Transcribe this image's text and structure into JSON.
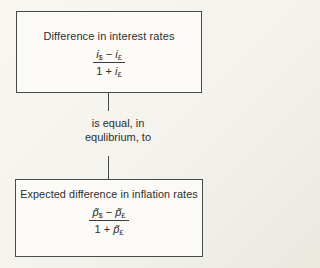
{
  "diagram": {
    "box1": {
      "title": "Difference in interest rates",
      "formula": {
        "num": {
          "v1": "i",
          "s1": "$",
          "op": "−",
          "v2": "i",
          "s2": "£"
        },
        "den": {
          "pre": "1 +",
          "v": "i",
          "s": "£"
        }
      }
    },
    "connector": {
      "line1": "is equal, in",
      "line2": "equlibrium, to"
    },
    "box2": {
      "title": "Expected difference in inflation rates",
      "formula": {
        "num": {
          "v1": "p̃",
          "s1": "$",
          "op": "−",
          "v2": "p̃",
          "s2": "£"
        },
        "den": {
          "pre": "1 +",
          "v": "p̃",
          "s": "£"
        }
      }
    },
    "colors": {
      "border": "#4a4a4a",
      "text": "#2e2e2e",
      "background": "#f3f2ec",
      "box_background": "#fbfaf6"
    }
  }
}
